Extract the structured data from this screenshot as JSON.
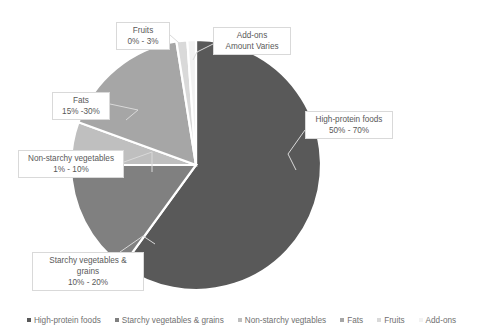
{
  "chart_data": {
    "type": "pie",
    "title": "",
    "subtitle": "",
    "xlabel": "",
    "ylabel": "",
    "legend_position": "bottom",
    "grid": false,
    "categories": [
      "High-protein foods",
      "Starchy vegetables & grains",
      "Non-starchy vegtables",
      "Fats",
      "Fruits",
      "Add-ons"
    ],
    "values": [
      60,
      15,
      5.5,
      22.5,
      1.5,
      2
    ],
    "value_labels": [
      "50% - 70%",
      "10% - 20%",
      "1% - 10%",
      "15% -30%",
      "0% - 3%",
      "Amount Varies"
    ],
    "colors": [
      "#595959",
      "#808080",
      "#bfbfbf",
      "#a6a6a6",
      "#d9d9d9",
      "#f2f2f2"
    ],
    "start_angle_deg": 0,
    "direction": "clockwise"
  },
  "labels": {
    "high_protein": {
      "name": "High-protein foods",
      "value": "50% - 70%"
    },
    "starchy": {
      "name_line1": "Starchy vegetables &",
      "name_line2": "grains",
      "value": "10% - 20%"
    },
    "non_starchy": {
      "name": "Non-starchy vegetables",
      "value": "1% - 10%"
    },
    "fats": {
      "name": "Fats",
      "value": "15% -30%"
    },
    "fruits": {
      "name": "Fruits",
      "value": "0% - 3%"
    },
    "addons": {
      "name": "Add-ons",
      "value": "Amount Varies"
    }
  },
  "legend": {
    "items": [
      {
        "label": "High-protein foods",
        "color": "#595959"
      },
      {
        "label": "Starchy vegetables & grains",
        "color": "#808080"
      },
      {
        "label": "Non-starchy vegtables",
        "color": "#bfbfbf"
      },
      {
        "label": "Fats",
        "color": "#a6a6a6"
      },
      {
        "label": "Fruits",
        "color": "#d9d9d9"
      },
      {
        "label": "Add-ons",
        "color": "#f2f2f2"
      }
    ]
  }
}
